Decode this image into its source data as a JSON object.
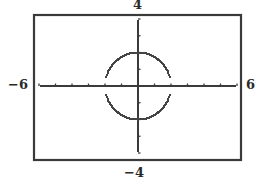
{
  "window": {
    "xmin_label": "−6",
    "xmax_label": "6",
    "ymin_label": "−4",
    "ymax_label": "4"
  },
  "colors": {
    "frame": "#3a3a3a",
    "axis": "#3a3a3a",
    "curve": "#444444",
    "background": "#ffffff"
  },
  "chart_data": {
    "type": "line",
    "title": "",
    "xlabel": "",
    "ylabel": "",
    "xlim": [
      -6,
      6
    ],
    "ylim": [
      -4,
      4
    ],
    "xscale_ticks": 1,
    "yscale_ticks": 1,
    "grid": false,
    "legend": null,
    "edge_labels": {
      "left": "−6",
      "right": "6",
      "top": "4",
      "bottom": "−4"
    },
    "series": [
      {
        "name": "upper semicircle y = √(4 − x²)",
        "equation": "y = sqrt(4 - x^2)",
        "x": [
          -2.0,
          -1.9,
          -1.75,
          -1.5,
          -1.25,
          -1.0,
          -0.75,
          -0.5,
          -0.25,
          0.0,
          0.25,
          0.5,
          0.75,
          1.0,
          1.25,
          1.5,
          1.75,
          1.9,
          2.0
        ],
        "y": [
          0.55,
          0.62,
          0.97,
          1.32,
          1.56,
          1.73,
          1.85,
          1.94,
          1.98,
          2.0,
          1.98,
          1.94,
          1.85,
          1.73,
          1.56,
          1.32,
          0.97,
          0.62,
          0.55
        ]
      },
      {
        "name": "lower semicircle y = −√(4 − x²)",
        "equation": "y = -sqrt(4 - x^2)",
        "x": [
          -2.0,
          -1.9,
          -1.75,
          -1.5,
          -1.25,
          -1.0,
          -0.75,
          -0.5,
          -0.25,
          0.0,
          0.25,
          0.5,
          0.75,
          1.0,
          1.25,
          1.5,
          1.75,
          1.9,
          2.0
        ],
        "y": [
          -0.55,
          -0.62,
          -0.97,
          -1.32,
          -1.56,
          -1.73,
          -1.85,
          -1.94,
          -1.98,
          -2.0,
          -1.98,
          -1.94,
          -1.85,
          -1.73,
          -1.56,
          -1.32,
          -0.97,
          -0.62,
          -0.55
        ]
      }
    ],
    "annotations": [
      "Gaps in the curve near the x-axis at x = ±2 (calculator plotting of semicircles)"
    ]
  }
}
